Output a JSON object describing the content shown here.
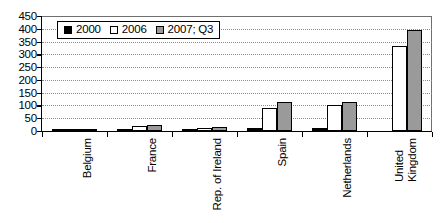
{
  "chart_data": {
    "type": "bar",
    "title": "",
    "subtitle": "",
    "xlabel": "",
    "ylabel": "",
    "ylim": [
      0,
      450
    ],
    "ytick_step": 50,
    "yticks": [
      450,
      400,
      350,
      300,
      250,
      200,
      150,
      100,
      50,
      0
    ],
    "ytick_labels": [
      "450",
      "400",
      "350",
      "300",
      "250",
      "200",
      "150",
      "100",
      "50",
      "0"
    ],
    "grid": true,
    "grid_axis": "y",
    "grid_style": "dotted",
    "legend_position": "upper-left-inside",
    "categories": [
      "Belgium",
      "France",
      "Rep. of Ireland",
      "Spain",
      "Netherlands",
      "United Kingdom"
    ],
    "category_label_rotation": -90,
    "category_label_lines": [
      [
        "Belgium"
      ],
      [
        "France"
      ],
      [
        "Rep. of Ireland"
      ],
      [
        "Spain"
      ],
      [
        "Netherlands"
      ],
      [
        "United",
        "Kingdom"
      ]
    ],
    "series": [
      {
        "name": "2000",
        "color": "#000000",
        "values": [
          1,
          6,
          2,
          11,
          11,
          0
        ]
      },
      {
        "name": "2006",
        "color": "#ffffff",
        "values": [
          3,
          21,
          12,
          92,
          103,
          334
        ]
      },
      {
        "name": "2007; Q3",
        "color": "#9a9a9a",
        "values": [
          6,
          22,
          15,
          115,
          114,
          397
        ]
      }
    ]
  },
  "legend": {
    "entries": [
      {
        "label": "2000",
        "swatch": "black-square-swatch"
      },
      {
        "label": "2006",
        "swatch": "white-square-swatch"
      },
      {
        "label": "2007; Q3",
        "swatch": "gray-square-swatch"
      }
    ]
  },
  "colors": {
    "series_2000": "#000000",
    "series_2006": "#ffffff",
    "series_2007": "#9a9a9a",
    "axis": "#000000",
    "gridline": "#8d8d8d",
    "background": "#ffffff"
  }
}
